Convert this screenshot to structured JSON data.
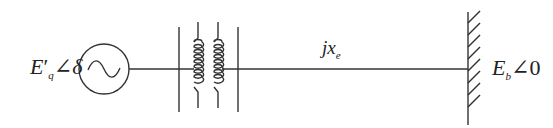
{
  "diagram": {
    "type": "single-machine infinite-bus",
    "generator": {
      "label_main": "E",
      "label_prime": "′",
      "label_sub": "q",
      "label_angle": "∠",
      "label_phase": "δ",
      "symbol": "ac-source-circle"
    },
    "transformer": {
      "symbol": "two-winding-transformer"
    },
    "line": {
      "label_j": "jx",
      "label_sub": "e"
    },
    "infinite_bus": {
      "label_main": "E",
      "label_sub": "b",
      "label_angle": "∠",
      "label_phase": "0"
    },
    "colors": {
      "stroke": "#333333",
      "background": "#ffffff"
    }
  }
}
